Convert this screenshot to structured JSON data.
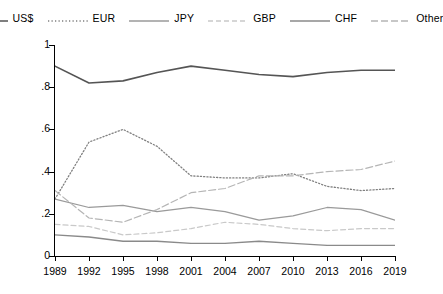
{
  "chart_data": {
    "type": "line",
    "title": "",
    "xlabel": "",
    "ylabel": "Foreign exchange market turnover (share)",
    "x": [
      1989,
      1992,
      1995,
      1998,
      2001,
      2004,
      2007,
      2010,
      2013,
      2016,
      2019
    ],
    "xticklabels": [
      "1989",
      "1992",
      "1995",
      "1998",
      "2001",
      "2004",
      "2007",
      "2010",
      "2013",
      "2016",
      "2019"
    ],
    "yticks": [
      0,
      0.2,
      0.4,
      0.6,
      0.8,
      1
    ],
    "yticklabels": [
      "0",
      ".2",
      ".4",
      ".6",
      ".8",
      "1"
    ],
    "ylim": [
      0,
      1
    ],
    "xlim": [
      1989,
      2019
    ],
    "grid": false,
    "legend_position": "top",
    "series": [
      {
        "name": "US$",
        "style": "solid",
        "color": "#555555",
        "width": 1.6,
        "values": [
          0.9,
          0.82,
          0.83,
          0.87,
          0.9,
          0.88,
          0.86,
          0.85,
          0.87,
          0.88,
          0.88
        ]
      },
      {
        "name": "EUR",
        "style": "dotted",
        "color": "#808080",
        "width": 1.3,
        "values": [
          0.27,
          0.54,
          0.6,
          0.52,
          0.38,
          0.37,
          0.37,
          0.39,
          0.33,
          0.31,
          0.32
        ]
      },
      {
        "name": "JPY",
        "style": "solid",
        "color": "#9a9a9a",
        "width": 1.2,
        "values": [
          0.27,
          0.23,
          0.24,
          0.21,
          0.23,
          0.21,
          0.17,
          0.19,
          0.23,
          0.22,
          0.17
        ]
      },
      {
        "name": "GBP",
        "style": "dashed",
        "color": "#c9c9c9",
        "width": 1.2,
        "values": [
          0.15,
          0.14,
          0.1,
          0.11,
          0.13,
          0.16,
          0.15,
          0.13,
          0.12,
          0.13,
          0.13
        ]
      },
      {
        "name": "CHF",
        "style": "solid",
        "color": "#8a8a8a",
        "width": 1.3,
        "values": [
          0.1,
          0.09,
          0.07,
          0.07,
          0.06,
          0.06,
          0.07,
          0.06,
          0.05,
          0.05,
          0.05
        ]
      },
      {
        "name": "Other",
        "style": "dashdot",
        "color": "#b5b5b5",
        "width": 1.2,
        "values": [
          0.31,
          0.18,
          0.16,
          0.22,
          0.3,
          0.32,
          0.38,
          0.38,
          0.4,
          0.41,
          0.45
        ]
      }
    ]
  },
  "legend": {
    "items": [
      {
        "label": "US$",
        "style": "solid",
        "color": "#555555"
      },
      {
        "label": "EUR",
        "style": "dotted",
        "color": "#808080"
      },
      {
        "label": "JPY",
        "style": "solid",
        "color": "#9a9a9a"
      },
      {
        "label": "GBP",
        "style": "dashed",
        "color": "#c9c9c9"
      },
      {
        "label": "CHF",
        "style": "solid",
        "color": "#8a8a8a"
      },
      {
        "label": "Other",
        "style": "dashdot",
        "color": "#b5b5b5"
      }
    ]
  },
  "axis": {
    "y_title": "Foreign exchange market turnover (share)"
  }
}
